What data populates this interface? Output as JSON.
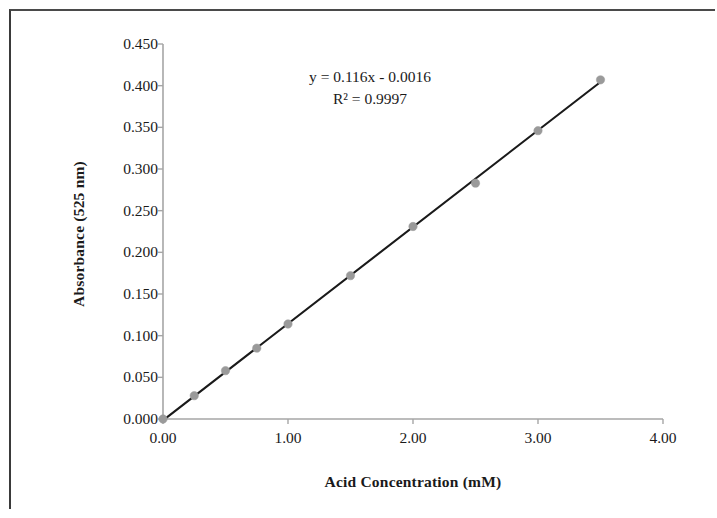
{
  "chart_data": {
    "type": "scatter",
    "title": "",
    "xlabel": "Acid Concentration (mM)",
    "ylabel": "Absorbance (525 nm)",
    "xlim": [
      0.0,
      4.0
    ],
    "ylim": [
      0.0,
      0.45
    ],
    "xticks": [
      "0.00",
      "1.00",
      "2.00",
      "3.00",
      "4.00"
    ],
    "xtick_values": [
      0.0,
      1.0,
      2.0,
      3.0,
      4.0
    ],
    "yticks": [
      "0.000",
      "0.050",
      "0.100",
      "0.150",
      "0.200",
      "0.250",
      "0.300",
      "0.350",
      "0.400",
      "0.450"
    ],
    "ytick_values": [
      0.0,
      0.05,
      0.1,
      0.15,
      0.2,
      0.25,
      0.3,
      0.35,
      0.4,
      0.45
    ],
    "grid": false,
    "legend": "none",
    "marker_color": "#9a9a9a",
    "line_color": "#1a1a1a",
    "axis_color": "#a6a6a6",
    "x": [
      0.0,
      0.25,
      0.5,
      0.75,
      1.0,
      1.5,
      2.0,
      2.5,
      3.0,
      3.5
    ],
    "y": [
      0.0,
      0.028,
      0.058,
      0.085,
      0.114,
      0.172,
      0.231,
      0.283,
      0.346,
      0.407
    ],
    "series": [
      {
        "name": "Absorbance",
        "points": [
          {
            "x": 0.0,
            "y": 0.0
          },
          {
            "x": 0.25,
            "y": 0.028
          },
          {
            "x": 0.5,
            "y": 0.058
          },
          {
            "x": 0.75,
            "y": 0.085
          },
          {
            "x": 1.0,
            "y": 0.114
          },
          {
            "x": 1.5,
            "y": 0.172
          },
          {
            "x": 2.0,
            "y": 0.231
          },
          {
            "x": 2.5,
            "y": 0.283
          },
          {
            "x": 3.0,
            "y": 0.346
          },
          {
            "x": 3.5,
            "y": 0.407
          }
        ]
      }
    ],
    "trendline": {
      "type": "linear",
      "slope": 0.116,
      "intercept": -0.0016,
      "equation": "y = 0.116x - 0.0016",
      "r_squared_label": "R² = 0.9997",
      "r_squared": 0.9997,
      "x_start": 0.0,
      "x_end": 3.5
    }
  },
  "annotations": {
    "equation": "y = 0.116x - 0.0016",
    "r_squared": "R² = 0.9997"
  }
}
